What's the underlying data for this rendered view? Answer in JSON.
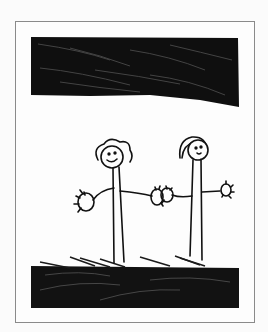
{
  "image": {
    "description": "Child's crayon/marker drawing of two stick figures holding hands under a dark scribbled sky, standing on dark scribbled ground, inside a thin gray frame",
    "colors": {
      "background": "#fbfbfb",
      "frame": "#8a8a8a",
      "ink": "#111111",
      "paper": "#fdfdfd"
    },
    "elements": [
      "frame",
      "sky-band",
      "ground-band",
      "figure-left",
      "figure-right"
    ]
  }
}
